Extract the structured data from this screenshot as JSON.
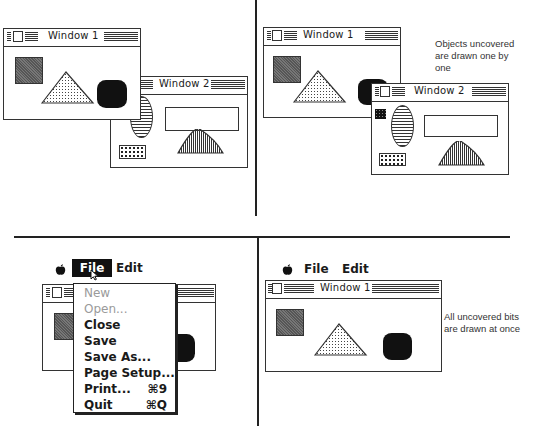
{
  "panels": {
    "top_left": {
      "window1": {
        "title": "Window 1"
      },
      "window2": {
        "title": "Window 2"
      }
    },
    "top_right": {
      "window1": {
        "title": "Window 1"
      },
      "window2": {
        "title": "Window 2"
      },
      "caption_lines": [
        "Objects uncovered",
        "are drawn one by",
        "one"
      ]
    },
    "bottom_left": {
      "menubar": {
        "apple": "",
        "apple_fallback": "●",
        "file": "File",
        "edit": "Edit"
      },
      "file_menu": {
        "items": [
          {
            "label": "New",
            "shortcut": "",
            "enabled": false
          },
          {
            "label": "Open...",
            "shortcut": "",
            "enabled": false
          },
          {
            "label": "Close",
            "shortcut": "",
            "enabled": true
          },
          {
            "label": "Save",
            "shortcut": "",
            "enabled": true
          },
          {
            "label": "Save As...",
            "shortcut": "",
            "enabled": true
          },
          {
            "label": "Page Setup...",
            "shortcut": "",
            "enabled": true
          },
          {
            "label": "Print...",
            "shortcut": "⌘9",
            "enabled": true
          },
          {
            "label": "Quit",
            "shortcut": "⌘Q",
            "enabled": true
          }
        ]
      }
    },
    "bottom_right": {
      "menubar": {
        "file": "File",
        "edit": "Edit"
      },
      "window1": {
        "title": "Window 1"
      },
      "caption_lines": [
        "All uncovered bits",
        "are drawn at once"
      ]
    }
  },
  "colors": {
    "ink": "#222222",
    "paper": "#ffffff",
    "disabled": "#9a9a9a"
  }
}
